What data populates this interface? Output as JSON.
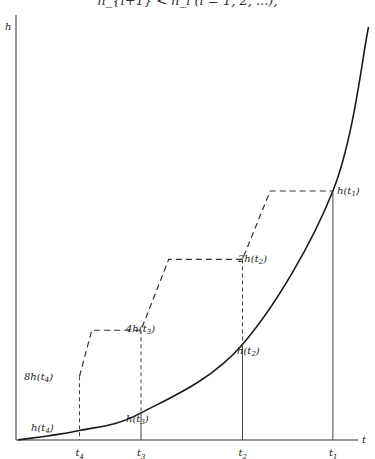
{
  "header": {
    "formula_fragment": "h_{i+1} < h_i   (i = 1, 2, ...),"
  },
  "chart_data": {
    "type": "line",
    "title": "",
    "xlabel": "t",
    "ylabel": "h",
    "grid": false,
    "x_ticks": [
      {
        "label": "t4",
        "sub": "4",
        "x": 1
      },
      {
        "label": "t3",
        "sub": "3",
        "x": 2
      },
      {
        "label": "t2",
        "sub": "2",
        "x": 3.65
      },
      {
        "label": "t1",
        "sub": "1",
        "x": 5.12
      }
    ],
    "curve": {
      "name": "h(t)",
      "shape": "increasing convex",
      "x": [
        0.0,
        1.0,
        2.0,
        3.65,
        5.12,
        5.7
      ],
      "y": [
        0.0,
        0.08,
        0.23,
        0.81,
        2.11,
        3.5
      ]
    },
    "staircase": {
      "name": "doubling envelope",
      "points": [
        {
          "x": 1.0,
          "y": 0.54
        },
        {
          "x": 1.2,
          "y": 0.93
        },
        {
          "x": 2.0,
          "y": 0.93
        },
        {
          "x": 2.45,
          "y": 1.53
        },
        {
          "x": 3.65,
          "y": 1.53
        },
        {
          "x": 4.1,
          "y": 2.11
        },
        {
          "x": 5.12,
          "y": 2.11
        }
      ]
    },
    "annotations": [
      {
        "text": "h(t",
        "sub": "1",
        "tail": ")",
        "prefix": "",
        "at": "t1-curve"
      },
      {
        "text": "h(t",
        "sub": "2",
        "tail": ")",
        "prefix": "",
        "at": "t2-curve"
      },
      {
        "text": "h(t",
        "sub": "3",
        "tail": ")",
        "prefix": "",
        "at": "t3-curve"
      },
      {
        "text": "h(t",
        "sub": "4",
        "tail": ")",
        "prefix": "",
        "at": "t4-curve"
      },
      {
        "text": "h(t",
        "sub": "2",
        "tail": ")",
        "prefix": "2",
        "at": "t2-stair"
      },
      {
        "text": "h(t",
        "sub": "3",
        "tail": ")",
        "prefix": "4",
        "at": "t3-stair"
      },
      {
        "text": "h(t",
        "sub": "4",
        "tail": ")",
        "prefix": "8",
        "at": "t4-stair"
      }
    ],
    "axis_labels": {
      "y": "h",
      "x": "t"
    }
  }
}
